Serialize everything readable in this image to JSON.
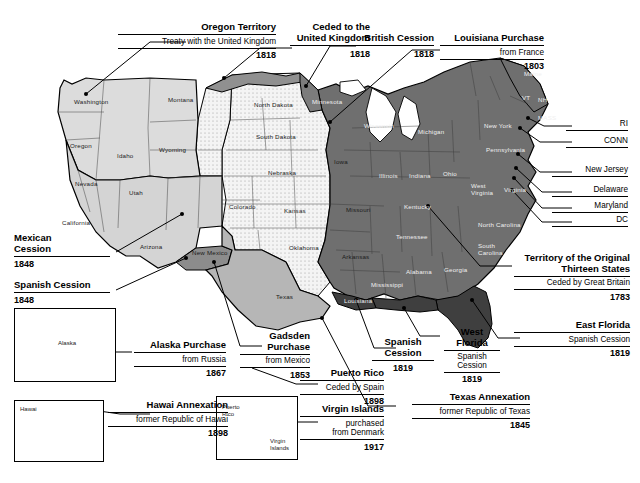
{
  "map": {
    "title": "United States territorial acquisitions map",
    "colors": {
      "original_thirteen": "#6e6e6e",
      "louisiana_purchase": "#f2f2f2",
      "mexican_cession": "#d2d2d2",
      "oregon_territory": "#d9d9d9",
      "texas_annexation": "#b3b3b3",
      "florida_cession": "#4a4a4a",
      "gadsden": "#8a8a8a",
      "ceded_away": "#8f8f8f",
      "background": "#ffffff",
      "outline": "#000000"
    },
    "callouts": [
      {
        "id": "oregon-territory",
        "title": "Oregon Territory",
        "sub": "Treaty with the United Kingdom",
        "year": "1818"
      },
      {
        "id": "ceded-to-united-kingdom",
        "title": "Ceded to the\nUnited Kingdom",
        "sub": "",
        "year": "1818"
      },
      {
        "id": "british-cession",
        "title": "British Cession",
        "sub": "",
        "year": "1818"
      },
      {
        "id": "louisiana-purchase",
        "title": "Louisiana Purchase",
        "sub": "from France",
        "year": "1803"
      },
      {
        "id": "mexican-cession",
        "title": "Mexican\nCession",
        "sub": "",
        "year": "1848"
      },
      {
        "id": "spanish-cession-west",
        "title": "Spanish Cession",
        "sub": "",
        "year": "1848"
      },
      {
        "id": "alaska-purchase",
        "title": "Alaska Purchase",
        "sub": "from Russia",
        "year": "1867"
      },
      {
        "id": "gadsden-purchase",
        "title": "Gadsden\nPurchase",
        "sub": "from Mexico",
        "year": "1853"
      },
      {
        "id": "puerto-rico",
        "title": "Puerto Rico",
        "sub": "Ceded by Spain",
        "year": "1898"
      },
      {
        "id": "virgin-islands",
        "title": "Virgin Islands",
        "sub": "purchased\nfrom Denmark",
        "year": "1917"
      },
      {
        "id": "hawai-annexation",
        "title": "Hawai Annexation",
        "sub": "former Republic of Hawai",
        "year": "1898"
      },
      {
        "id": "spanish-cession-gulf",
        "title": "Spanish\nCession",
        "sub": "",
        "year": "1819"
      },
      {
        "id": "west-florida",
        "title": "West\nFlorida",
        "sub": "Spanish\nCession",
        "year": "1819"
      },
      {
        "id": "texas-annexation",
        "title": "Texas Annexation",
        "sub": "former Republic of Texas",
        "year": "1845"
      },
      {
        "id": "original-thirteen",
        "title": "Territory of the Original\nThirteen States",
        "sub": "Ceded by Great Britain",
        "year": "1783"
      },
      {
        "id": "east-florida",
        "title": "East Florida",
        "sub": "Spanish Cession",
        "year": "1819"
      }
    ],
    "edge_labels": [
      {
        "id": "ri",
        "label": "RI"
      },
      {
        "id": "conn",
        "label": "CONN"
      },
      {
        "id": "new-jersey",
        "label": "New Jersey"
      },
      {
        "id": "delaware",
        "label": "Delaware"
      },
      {
        "id": "maryland",
        "label": "Maryland"
      },
      {
        "id": "dc",
        "label": "DC"
      }
    ],
    "state_labels": [
      {
        "name": "Washington"
      },
      {
        "name": "Oregon"
      },
      {
        "name": "Idaho"
      },
      {
        "name": "Montana"
      },
      {
        "name": "Wyoming"
      },
      {
        "name": "Nevada"
      },
      {
        "name": "Utah"
      },
      {
        "name": "California"
      },
      {
        "name": "Arizona"
      },
      {
        "name": "New Mexico"
      },
      {
        "name": "Colorado"
      },
      {
        "name": "North Dakota"
      },
      {
        "name": "South Dakota"
      },
      {
        "name": "Nebraska"
      },
      {
        "name": "Kansas"
      },
      {
        "name": "Oklahoma"
      },
      {
        "name": "Texas"
      },
      {
        "name": "Minnesota"
      },
      {
        "name": "Iowa"
      },
      {
        "name": "Missouri"
      },
      {
        "name": "Arkansas"
      },
      {
        "name": "Louisiana"
      },
      {
        "name": "Wisconsin"
      },
      {
        "name": "Michigan"
      },
      {
        "name": "Illinois"
      },
      {
        "name": "Indiana"
      },
      {
        "name": "Ohio"
      },
      {
        "name": "Kentucky"
      },
      {
        "name": "Tennessee"
      },
      {
        "name": "Mississippi"
      },
      {
        "name": "Alabama"
      },
      {
        "name": "Georgia"
      },
      {
        "name": "West Virginia"
      },
      {
        "name": "Virginia"
      },
      {
        "name": "North Carolina"
      },
      {
        "name": "South Carolina"
      },
      {
        "name": "Pennsylvania"
      },
      {
        "name": "New York"
      },
      {
        "name": "Maine"
      },
      {
        "name": "VT"
      },
      {
        "name": "NH"
      },
      {
        "name": "MASS"
      }
    ],
    "insets": [
      {
        "id": "alaska-inset",
        "label": "Alaska"
      },
      {
        "id": "hawaii-inset",
        "label": "Hawai"
      },
      {
        "id": "caribbean-inset",
        "labels": [
          "Puerto\nRico",
          "Virgin\nIslands"
        ]
      }
    ]
  }
}
